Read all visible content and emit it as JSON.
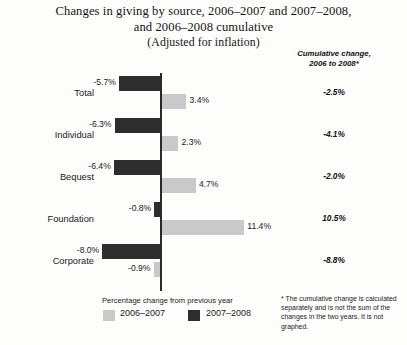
{
  "title": {
    "line1": "Changes in giving by source, 2006–2007 and 2007–2008,",
    "line2": "and 2006–2008 cumulative",
    "line3": "(Adjusted for inflation)"
  },
  "cumulative_header": {
    "line1": "Cumulative change,",
    "line2": "2006 to 2008*"
  },
  "legend": {
    "caption": "Percentage change from previous year",
    "items": [
      {
        "label": "2006–2007",
        "color": "#c9c9c9"
      },
      {
        "label": "2007–2008",
        "color": "#2e2e2e"
      }
    ]
  },
  "footnote": "* The cumulative change is calculated separately and is not the sum of the changes in the two years. It is not graphed.",
  "chart_data": {
    "type": "bar",
    "orientation": "horizontal",
    "title": "Changes in giving by source, 2006–2007 and 2007–2008, and 2006–2008 cumulative (Adjusted for inflation)",
    "xlabel": "Percentage change from previous year",
    "ylabel": "",
    "categories": [
      "Total",
      "Individual",
      "Bequest",
      "Foundation",
      "Corporate"
    ],
    "series": [
      {
        "name": "2007–2008",
        "color": "#2e2e2e",
        "values": [
          -5.7,
          -6.3,
          -6.4,
          -0.8,
          -8.0
        ],
        "labels": [
          "-5.7%",
          "-6.3%",
          "-6.4%",
          "-0.8%",
          "-8.0%"
        ]
      },
      {
        "name": "2006–2007",
        "color": "#c9c9c9",
        "values": [
          3.4,
          2.3,
          4.7,
          11.4,
          -0.9
        ],
        "labels": [
          "3.4%",
          "2.3%",
          "4.7%",
          "11.4%",
          "-0.9%"
        ]
      }
    ],
    "annotation_column": {
      "header": "Cumulative change, 2006 to 2008*",
      "values": [
        -2.5,
        -4.1,
        -2.0,
        10.5,
        -8.8
      ],
      "labels": [
        "-2.5%",
        "-4.1%",
        "-2.0%",
        "10.5%",
        "-8.8%"
      ]
    },
    "xlim": [
      -10,
      13
    ],
    "grid": false,
    "zero_axis": true,
    "legend_position": "bottom-left"
  }
}
